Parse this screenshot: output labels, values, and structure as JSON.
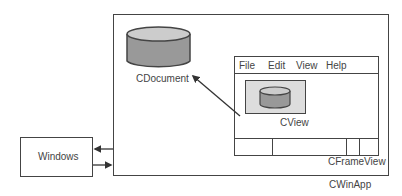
{
  "diagram": {
    "app_label": "CWinApp",
    "os_label": "Windows",
    "document_label": "CDocument",
    "frame_label": "CFrameView",
    "view_label": "CView",
    "menu": [
      "File",
      "Edit",
      "View",
      "Help"
    ],
    "colors": {
      "cylinder_body": "#999999",
      "cylinder_top": "#cccccc",
      "view_bg": "#dddddd",
      "stroke": "#444444"
    },
    "arrows": [
      {
        "from": "CView",
        "to": "CDocument"
      },
      {
        "from": "CWinApp",
        "to": "Windows"
      },
      {
        "from": "Windows",
        "to": "CWinApp"
      }
    ]
  }
}
